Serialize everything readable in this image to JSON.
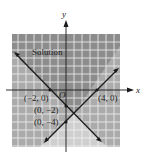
{
  "figure": {
    "type": "system_of_linear_inequalities_graph",
    "axes": {
      "x_label": "x",
      "y_label": "y",
      "origin_label": "O"
    },
    "region_label": "Solution",
    "lines": [
      {
        "name": "line-1",
        "through": [
          [
            -2,
            0
          ],
          [
            0,
            -2
          ]
        ],
        "equation": "y = -x - 2"
      },
      {
        "name": "line-2",
        "through": [
          [
            4,
            0
          ],
          [
            0,
            -4
          ]
        ],
        "equation": "y = x - 4"
      }
    ],
    "points": [
      {
        "label": "(−2, 0)",
        "x": -2,
        "y": 0
      },
      {
        "label": "(4, 0)",
        "x": 4,
        "y": 0
      },
      {
        "label": "(0, −2)",
        "x": 0,
        "y": -2
      },
      {
        "label": "(0, −4)",
        "x": 0,
        "y": -4
      }
    ],
    "colors": {
      "solution_region": "#8c8c8c",
      "single_shaded": "#ababab",
      "unshaded_grid": "#cfcfcf",
      "grid_lines": "#f2f2f2",
      "lines": "#1a1a1a"
    }
  }
}
